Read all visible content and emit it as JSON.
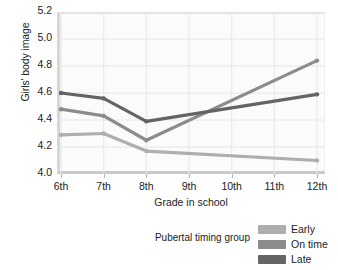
{
  "chart_data": {
    "type": "line",
    "title": "",
    "xlabel": "Grade in school",
    "ylabel": "Girls' body image",
    "categories": [
      "6th",
      "7th",
      "8th",
      "9th",
      "10th",
      "11th",
      "12th"
    ],
    "ylim": [
      4.0,
      5.2
    ],
    "yticks": [
      "4.0",
      "4.2",
      "4.4",
      "4.6",
      "4.8",
      "5.0",
      "5.2"
    ],
    "ytick_values": [
      4.0,
      4.2,
      4.4,
      4.6,
      4.8,
      5.0,
      5.2
    ],
    "grid": true,
    "legend_position": "below-right",
    "legend_title": "Pubertal timing group",
    "series": [
      {
        "name": "Early",
        "color": "#aeaeae",
        "x": [
          "6th",
          "7th",
          "8th",
          "12th"
        ],
        "values": [
          4.29,
          4.3,
          4.17,
          4.1
        ]
      },
      {
        "name": "On time",
        "color": "#8c8c8c",
        "x": [
          "6th",
          "7th",
          "8th",
          "12th"
        ],
        "values": [
          4.48,
          4.43,
          4.25,
          4.84
        ]
      },
      {
        "name": "Late",
        "color": "#646464",
        "x": [
          "6th",
          "7th",
          "8th",
          "12th"
        ],
        "values": [
          4.6,
          4.56,
          4.39,
          4.59
        ]
      }
    ]
  },
  "legend": {
    "caption": "Pubertal timing group",
    "entries": [
      {
        "label": "Early",
        "color": "#aeaeae"
      },
      {
        "label": "On time",
        "color": "#8c8c8c"
      },
      {
        "label": "Late",
        "color": "#646464"
      }
    ]
  },
  "axes": {
    "y_title": "Girls' body image",
    "x_title": "Grade in school"
  }
}
